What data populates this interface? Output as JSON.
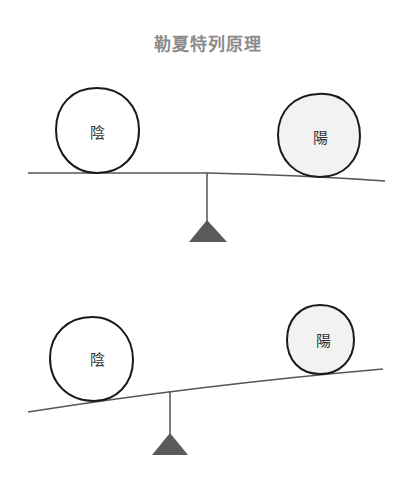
{
  "title": "勒夏特列原理",
  "colors": {
    "outline": "#1a1a1a",
    "beam": "#555555",
    "fulcrum": "#5a5a5a",
    "yang_fill": "#f2f2f2",
    "yin_fill": "#ffffff",
    "title": "#8a8a8a"
  },
  "diagrams": [
    {
      "state": "balanced",
      "left_ball": {
        "label": "陰"
      },
      "right_ball": {
        "label": "陽"
      }
    },
    {
      "state": "tilted",
      "left_ball": {
        "label": "陰"
      },
      "right_ball": {
        "label": "陽"
      }
    }
  ]
}
